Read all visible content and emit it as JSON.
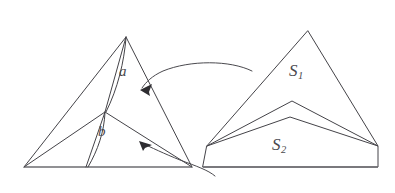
{
  "figure": {
    "background_color": "#ffffff",
    "line_color": "#444348",
    "baseline_color": "#6d6c70",
    "arrow_color": "#2e2d31",
    "labels": {
      "a": "a",
      "b": "b",
      "s1_base": "S",
      "s1_sub": "1",
      "s2_base": "S",
      "s2_sub": "2"
    },
    "left_shape": {
      "name": "subdivided-triangle",
      "apex": [
        126,
        37
      ],
      "bottom_left": [
        24,
        167
      ],
      "bottom_right": [
        192,
        167
      ],
      "interior_vertex": [
        105,
        112
      ],
      "foot_on_base": [
        86,
        167
      ]
    },
    "right_shape": {
      "name": "chevron-pair-triangle",
      "apex": [
        308,
        31
      ],
      "upper_chevron_peak": [
        292,
        101
      ],
      "lower_chevron_peak": [
        290,
        117
      ],
      "left_tip": [
        207,
        146
      ],
      "right_tip": [
        378,
        146
      ],
      "base_left": [
        203,
        167
      ],
      "base_right": [
        378,
        167
      ]
    },
    "arrows": [
      {
        "name": "upper-mapping-arrow",
        "from": [
          250,
          72
        ],
        "to": [
          141,
          89
        ],
        "direction": "right-to-left"
      },
      {
        "name": "lower-mapping-arrow",
        "from": [
          210,
          174
        ],
        "to": [
          140,
          142
        ],
        "direction": "right-to-left"
      }
    ]
  }
}
